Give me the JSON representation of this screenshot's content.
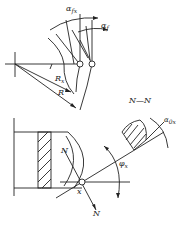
{
  "diagram": {
    "labels": {
      "alpha_fx": {
        "main": "α",
        "sub": "fx"
      },
      "alpha_f": {
        "main": "α",
        "sub": "f"
      },
      "R_x": {
        "main": "R",
        "sub": "x"
      },
      "R": {
        "main": "R"
      },
      "section": "N—N",
      "alpha_0x": {
        "main": "α",
        "sub": "0x"
      },
      "N_top": "N",
      "N_bottom": "N",
      "x_point": "x",
      "phi_x": {
        "main": "φ",
        "sub": "x"
      }
    },
    "colors": {
      "stroke": "#222222",
      "background": "#ffffff"
    }
  }
}
